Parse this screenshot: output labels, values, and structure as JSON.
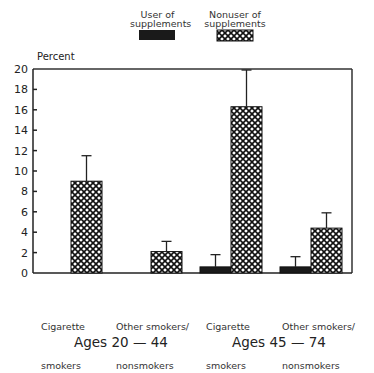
{
  "chart_data": {
    "type": "bar",
    "title": "",
    "xlabel": "",
    "ylabel": "Percent",
    "ylim": [
      0,
      20
    ],
    "yticks": [
      0,
      2,
      4,
      6,
      8,
      10,
      12,
      14,
      16,
      18,
      20
    ],
    "grid": false,
    "legend_position": "top",
    "groups": [
      "Ages 20 — 44",
      "Ages 45 — 74"
    ],
    "categories": [
      "Cigarette smokers (Ages 20-44)",
      "Other smokers/nonsmokers (Ages 20-44)",
      "Cigarette smokers (Ages 45-74)",
      "Other smokers/nonsmokers (Ages 45-74)"
    ],
    "series": [
      {
        "name": "User of supplements",
        "fill": "solid-black",
        "values": [
          null,
          null,
          0.6,
          0.6
        ],
        "error_upper": [
          null,
          null,
          1.8,
          1.6
        ]
      },
      {
        "name": "Nonuser of supplements",
        "fill": "crosshatch",
        "values": [
          9.0,
          2.1,
          16.3,
          4.4
        ],
        "error_upper": [
          11.5,
          3.1,
          19.9,
          5.9
        ]
      }
    ]
  },
  "legend": {
    "user_line1": "User of",
    "user_line2": "supplements",
    "nonuser_line1": "Nonuser of",
    "nonuser_line2": "supplements"
  },
  "axis": {
    "ylabel": "Percent",
    "ticks": [
      "0",
      "2",
      "4",
      "6",
      "8",
      "10",
      "12",
      "14",
      "16",
      "18",
      "20"
    ]
  },
  "categories": {
    "c1_line1": "Cigarette",
    "c1_line2": "smokers",
    "c2_line1": "Other smokers/",
    "c2_line2": "nonsmokers",
    "c3_line1": "Cigarette",
    "c3_line2": "smokers",
    "c4_line1": "Other smokers/",
    "c4_line2": "nonsmokers"
  },
  "groups": {
    "g1": "Ages 20 — 44",
    "g2": "Ages 45 — 74"
  },
  "colors": {
    "user": "#1a1a1a",
    "nonuser_bg": "#ffffff",
    "axis": "#222222"
  }
}
